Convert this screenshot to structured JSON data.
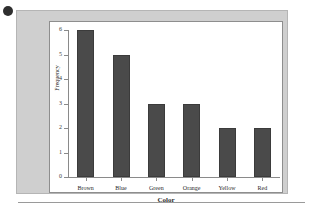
{
  "figure": {
    "bullet_icon": "bullet-dot-icon",
    "panel_bg": "#cfcfcf",
    "plot_bg": "#ffffff",
    "bar_color": "#4a4a4a",
    "axis_color": "#8a8a8a"
  },
  "chart_data": {
    "type": "bar",
    "title": "",
    "xlabel": "Color",
    "ylabel": "Frequency",
    "categories": [
      "Brown",
      "Blue",
      "Green",
      "Orange",
      "Yellow",
      "Red"
    ],
    "values": [
      6,
      5,
      3,
      3,
      2,
      2
    ],
    "ylim": [
      0,
      6
    ],
    "yticks": [
      0,
      1,
      2,
      3,
      4,
      5,
      6
    ],
    "ytick_labels": [
      "0",
      "1",
      "2",
      "3",
      "4",
      "5",
      "6"
    ],
    "grid": false,
    "legend": null
  }
}
